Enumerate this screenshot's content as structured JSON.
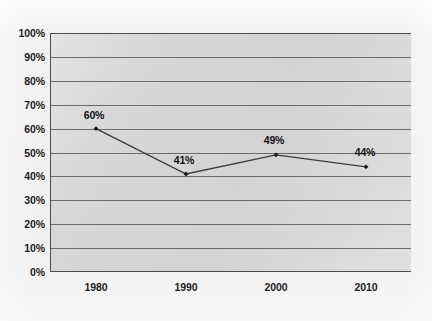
{
  "chart_data": {
    "type": "line",
    "title": "",
    "xlabel": "",
    "ylabel": "",
    "categories": [
      "1980",
      "1990",
      "2000",
      "2010"
    ],
    "x": [
      1980,
      1990,
      2000,
      2010
    ],
    "values": [
      60,
      41,
      49,
      44
    ],
    "point_labels": [
      "60%",
      "41%",
      "49%",
      "44%"
    ],
    "series": [
      {
        "name": "",
        "values": [
          60,
          41,
          49,
          44
        ]
      }
    ],
    "ylim": [
      0,
      100
    ],
    "ytick_values": [
      0,
      10,
      20,
      30,
      40,
      50,
      60,
      70,
      80,
      90,
      100
    ],
    "ytick_labels": [
      "0%",
      "10%",
      "20%",
      "30%",
      "40%",
      "50%",
      "60%",
      "70%",
      "80%",
      "90%",
      "100%"
    ],
    "xtick_labels": [
      "1980",
      "1990",
      "2000",
      "2010"
    ],
    "grid": "horizontal",
    "legend": "none",
    "colors": {
      "plot_background": "#d7d7d7",
      "page_background": "#f1f1f1",
      "gridline": "#6d6d6d",
      "axis": "#4b4b4b",
      "series_line": "#3c3c3c",
      "marker": "#1a1a1a",
      "text": "#1d1d1d"
    }
  }
}
